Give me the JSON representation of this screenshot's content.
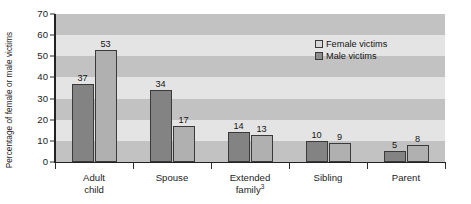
{
  "chart_data": {
    "type": "bar",
    "title": "",
    "subtitle": "",
    "xlabel": "",
    "ylabel": "Percentage of female or male victims",
    "ylim": [
      0,
      70
    ],
    "ytick_labels": [
      "0",
      "10",
      "20",
      "30",
      "40",
      "50",
      "60",
      "70"
    ],
    "ytick_values": [
      0,
      10,
      20,
      30,
      40,
      50,
      60,
      70
    ],
    "grid": "horizontal-banded-stripes",
    "legend_position": "top-right-inside",
    "categories": [
      "Adult child",
      "Spouse",
      "Extended family",
      "Sibling",
      "Parent"
    ],
    "category_lines": [
      [
        "Adult",
        "child"
      ],
      [
        "Spouse"
      ],
      [
        "Extended",
        "family"
      ],
      [
        "Sibling"
      ],
      [
        "Parent"
      ]
    ],
    "category_footnotes": [
      "",
      "",
      "3",
      "",
      ""
    ],
    "series": [
      {
        "name": "Female victims",
        "color": "#838383",
        "values": [
          37,
          34,
          14,
          10,
          5
        ]
      },
      {
        "name": "Male victims",
        "color": "#b0b0b0",
        "values": [
          53,
          17,
          13,
          9,
          8
        ]
      }
    ]
  },
  "legend": {
    "items": [
      {
        "label": "Female victims",
        "swatch": "female"
      },
      {
        "label": "Male victims",
        "swatch": "male"
      }
    ]
  },
  "colors": {
    "female_bar": "#838383",
    "male_bar": "#b0b0b0",
    "stripe_dark": "#c2c2c2",
    "stripe_light": "#e4e4e4",
    "axis": "#222222",
    "text": "#1c1c1c"
  }
}
